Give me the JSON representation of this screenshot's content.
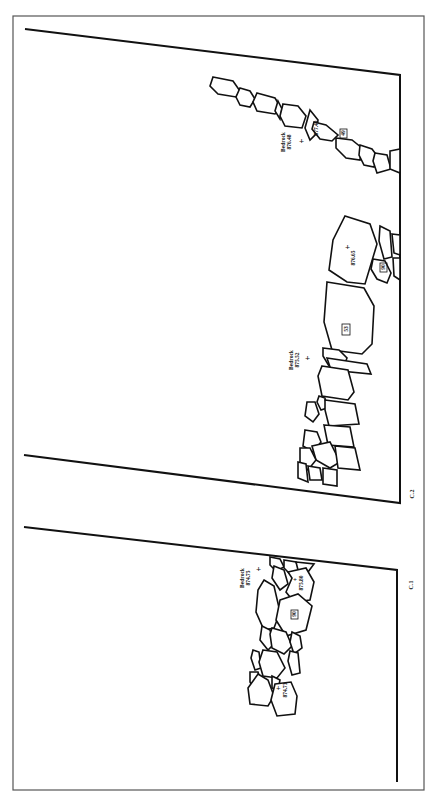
{
  "figure": {
    "panels": [
      {
        "id": "C.1",
        "label": "C.1",
        "bedrock": {
          "label": "Bedrock",
          "elevation": "874.75"
        },
        "stone_labels": [
          {
            "text": "875.80",
            "type": "elevation"
          },
          {
            "text": "90",
            "type": "boxed-id"
          },
          {
            "text": "874.73",
            "type": "elevation"
          }
        ]
      },
      {
        "id": "C.2",
        "label": "C.2",
        "bedrocks": [
          {
            "label": "Bedrock",
            "elevation": "875.52"
          },
          {
            "label": "Bedrock",
            "elevation": "876.48"
          }
        ],
        "stone_labels": [
          {
            "text": "53",
            "type": "boxed-id"
          },
          {
            "text": "876.65",
            "type": "elevation"
          },
          {
            "text": "90",
            "type": "boxed-id"
          },
          {
            "text": "877.49",
            "type": "elevation"
          },
          {
            "text": "49",
            "type": "boxed-id"
          }
        ]
      }
    ],
    "colors": {
      "ink": "#111111",
      "frame": "#555555",
      "background": "#ffffff"
    }
  }
}
